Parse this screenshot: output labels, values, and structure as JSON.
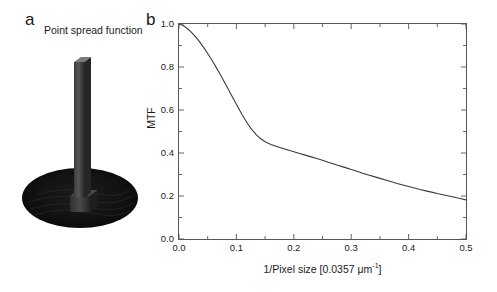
{
  "figure": {
    "panel_a": {
      "label": "a",
      "title": "Point spread function",
      "render_type": "3d-surface-spike"
    },
    "panel_b": {
      "label": "b",
      "annotation": "Modulation transfer function"
    }
  },
  "colors": {
    "curve": "#3a3a3a",
    "axis": "#555555",
    "text": "#1a1a1a",
    "psf_dark": "#101010",
    "psf_spike": "#4a4a4a",
    "psf_spike_top": "#6e6e6e",
    "background": "#ffffff"
  },
  "chart_data": {
    "type": "line",
    "title": "",
    "annotation": "Modulation transfer function",
    "xlabel": "1/Pixel size [0.0357 μm⁻¹]",
    "xlabel_main": "1/Pixel size [0.0357 ",
    "xlabel_unit": "μm",
    "xlabel_exponent": "-1",
    "xlabel_tail": "]",
    "ylabel": "MTF",
    "xlim": [
      0.0,
      0.5
    ],
    "ylim": [
      0.0,
      1.0
    ],
    "grid": false,
    "legend": false,
    "xticks": [
      0.0,
      0.1,
      0.2,
      0.3,
      0.4,
      0.5
    ],
    "xtick_labels": [
      "0.0",
      "0.1",
      "0.2",
      "0.3",
      "0.4",
      "0.5"
    ],
    "xminor_ticks": [
      0.05,
      0.15,
      0.25,
      0.35,
      0.45
    ],
    "yticks": [
      0.0,
      0.2,
      0.4,
      0.6,
      0.8,
      1.0
    ],
    "ytick_labels": [
      "0.0",
      "0.2",
      "0.4",
      "0.6",
      "0.8",
      "1.0"
    ],
    "yminor_ticks": [
      0.1,
      0.3,
      0.5,
      0.7,
      0.9
    ],
    "series": [
      {
        "name": "MTF",
        "x": [
          0.0,
          0.005,
          0.01,
          0.015,
          0.02,
          0.025,
          0.03,
          0.035,
          0.04,
          0.045,
          0.05,
          0.055,
          0.06,
          0.065,
          0.07,
          0.075,
          0.08,
          0.085,
          0.09,
          0.095,
          0.1,
          0.105,
          0.11,
          0.115,
          0.12,
          0.125,
          0.13,
          0.135,
          0.14,
          0.15,
          0.16,
          0.17,
          0.18,
          0.19,
          0.2,
          0.21,
          0.22,
          0.23,
          0.24,
          0.25,
          0.26,
          0.27,
          0.28,
          0.29,
          0.3,
          0.31,
          0.32,
          0.33,
          0.34,
          0.35,
          0.36,
          0.37,
          0.38,
          0.39,
          0.4,
          0.41,
          0.42,
          0.43,
          0.44,
          0.45,
          0.46,
          0.47,
          0.48,
          0.49,
          0.5
        ],
        "y": [
          1.0,
          0.995,
          0.988,
          0.978,
          0.966,
          0.952,
          0.937,
          0.92,
          0.902,
          0.883,
          0.863,
          0.842,
          0.82,
          0.797,
          0.774,
          0.75,
          0.726,
          0.701,
          0.676,
          0.651,
          0.627,
          0.602,
          0.578,
          0.556,
          0.535,
          0.516,
          0.499,
          0.484,
          0.471,
          0.452,
          0.44,
          0.43,
          0.422,
          0.414,
          0.406,
          0.398,
          0.39,
          0.382,
          0.374,
          0.366,
          0.357,
          0.349,
          0.34,
          0.332,
          0.323,
          0.315,
          0.306,
          0.298,
          0.29,
          0.282,
          0.274,
          0.266,
          0.258,
          0.251,
          0.244,
          0.237,
          0.23,
          0.224,
          0.218,
          0.212,
          0.206,
          0.2,
          0.194,
          0.188,
          0.182
        ]
      }
    ]
  }
}
